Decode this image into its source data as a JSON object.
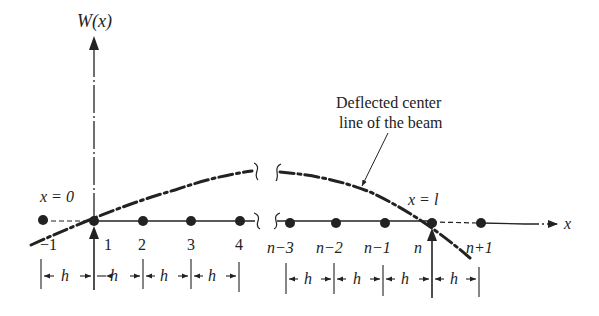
{
  "figure": {
    "y_axis_label": "W(x)",
    "x_axis_label": "x",
    "annotation": {
      "line1": "Deflected center",
      "line2": "line of the beam"
    },
    "boundary_labels": {
      "left": "x = 0",
      "right": "x = l"
    },
    "node_labels": [
      "−1",
      "1",
      "2",
      "3",
      "4",
      "n−3",
      "n−2",
      "n−1",
      "n",
      "n+1"
    ],
    "spacing_label": "h",
    "colors": {
      "ink": "#222222",
      "background": "#ffffff"
    }
  }
}
